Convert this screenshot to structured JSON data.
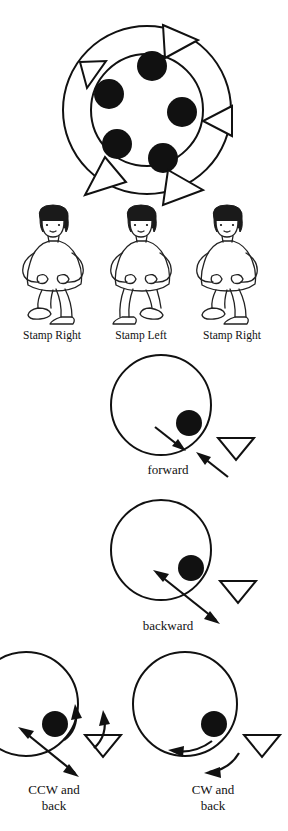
{
  "page": {
    "ink_color": "#111111",
    "background_color": "#ffffff"
  },
  "figures": {
    "circle_formation": {
      "name": "circle-formation-diagram",
      "description": "Large outer ring with five filled dots inside an inner circle and five open triangles spaced around the ring",
      "dot_count": 5,
      "triangle_count": 5,
      "triangles": [
        {
          "position": "top",
          "points": "right"
        },
        {
          "position": "upper-left",
          "points": "down-right"
        },
        {
          "position": "right",
          "points": "left"
        },
        {
          "position": "lower-left",
          "points": "up-right"
        },
        {
          "position": "bottom",
          "points": "up-right"
        }
      ]
    },
    "dancers": [
      {
        "label": "Stamp Right",
        "foot": "right"
      },
      {
        "label": "Stamp Left",
        "foot": "left"
      },
      {
        "label": "Stamp Right",
        "foot": "right"
      }
    ],
    "steps": [
      {
        "label": "forward",
        "name": "forward-step-diagram",
        "arrows": "two straight arrows pointing inward toward the circle edge",
        "dot_count": 1,
        "triangle_count": 1
      },
      {
        "label": "backward",
        "name": "backward-step-diagram",
        "arrows": "double-headed straight arrow angled out from the circle",
        "dot_count": 1,
        "triangle_count": 1
      },
      {
        "label": "CCW and\nback",
        "name": "ccw-step-diagram",
        "arrows": "two curved arrows pointing counterclockwise plus a double-headed straight arrow",
        "dot_count": 1,
        "triangle_count": 1
      },
      {
        "label": "CW and\nback",
        "name": "cw-step-diagram",
        "arrows": "two curved arrows pointing clockwise",
        "dot_count": 1,
        "triangle_count": 1
      }
    ]
  }
}
